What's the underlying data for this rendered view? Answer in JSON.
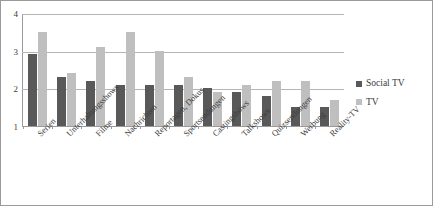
{
  "chart_data": {
    "type": "bar",
    "title": "",
    "subtitle": "",
    "xlabel": "",
    "ylabel": "",
    "ylim": [
      1,
      4
    ],
    "yticks": [
      4,
      3,
      2,
      1
    ],
    "grid": true,
    "legend_position": "right",
    "categories": [
      "Serien",
      "Unterhaltungsshows",
      "Filme",
      "Nachrichten",
      "Reportagen, Dokus",
      "Sportsendungen",
      "Castingshows",
      "Talkshows",
      "Quizsendungen",
      "Werbung",
      "Reality-TV"
    ],
    "series": [
      {
        "name": "Social TV",
        "color": "#595959",
        "values": [
          2.9,
          2.3,
          2.2,
          2.1,
          2.1,
          2.1,
          2.0,
          1.9,
          1.8,
          1.5,
          1.5
        ]
      },
      {
        "name": "TV",
        "color": "#bfbfbf",
        "values": [
          3.5,
          2.4,
          3.1,
          3.5,
          3.0,
          2.3,
          1.9,
          2.1,
          2.2,
          2.2,
          1.7
        ]
      }
    ]
  },
  "colors": {
    "social_tv": "#595959",
    "tv": "#bfbfbf",
    "gridline": "#b5b5b5",
    "axis": "#9a9a9a",
    "text": "#3b3b3b",
    "background": "#ffffff"
  }
}
